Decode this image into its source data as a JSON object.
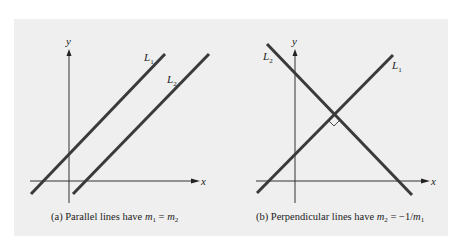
{
  "figure": {
    "background_color": "#efefef",
    "line_color": "#3a3a3a",
    "panels": [
      {
        "id": "a",
        "axis_x_label": "x",
        "axis_y_label": "y",
        "lines": [
          {
            "name": "L",
            "sub": "1"
          },
          {
            "name": "L",
            "sub": "2"
          }
        ],
        "caption_prefix": "(a) Parallel lines have ",
        "caption_m1": "m",
        "caption_m1_sub": "1",
        "caption_eq": " = ",
        "caption_m2": "m",
        "caption_m2_sub": "2"
      },
      {
        "id": "b",
        "axis_x_label": "x",
        "axis_y_label": "y",
        "lines": [
          {
            "name": "L",
            "sub": "1"
          },
          {
            "name": "L",
            "sub": "2"
          }
        ],
        "right_angle_marker": true,
        "caption_prefix": "(b) Perpendicular lines have ",
        "caption_m2": "m",
        "caption_m2_sub": "2",
        "caption_eq": " = −1/",
        "caption_m1": "m",
        "caption_m1_sub": "1"
      }
    ]
  }
}
